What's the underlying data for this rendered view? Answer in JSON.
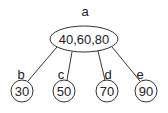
{
  "diagram": {
    "type": "tree",
    "root": {
      "name": "a",
      "keys": "40,60,80",
      "cx": 84,
      "cy": 39,
      "rx": 34,
      "ry": 13,
      "label_x": 85,
      "label_y": 16
    },
    "children": [
      {
        "name": "b",
        "key": "30",
        "cx": 22,
        "cy": 91,
        "r": 11,
        "label_x": 21,
        "label_y": 79,
        "edge_from": [
          57,
          47
        ],
        "edge_to": [
          28,
          81
        ]
      },
      {
        "name": "c",
        "key": "50",
        "cx": 64,
        "cy": 91,
        "r": 11,
        "label_x": 61,
        "label_y": 79,
        "edge_from": [
          72,
          52
        ],
        "edge_to": [
          67,
          80
        ]
      },
      {
        "name": "d",
        "key": "70",
        "cx": 107,
        "cy": 91,
        "r": 11,
        "label_x": 108,
        "label_y": 79,
        "edge_from": [
          98,
          51
        ],
        "edge_to": [
          105,
          80
        ]
      },
      {
        "name": "e",
        "key": "90",
        "cx": 146,
        "cy": 91,
        "r": 11,
        "label_x": 140,
        "label_y": 79,
        "edge_from": [
          112,
          47
        ],
        "edge_to": [
          140,
          81
        ]
      }
    ]
  }
}
